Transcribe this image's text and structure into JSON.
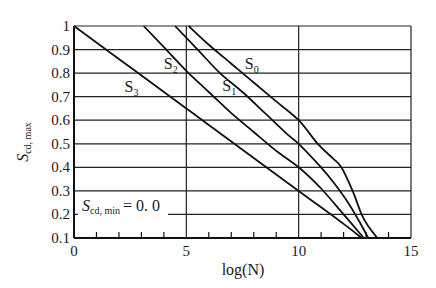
{
  "chart_data": {
    "type": "line",
    "title": "",
    "xlabel": "log(N)",
    "ylabel": "S_cd,max",
    "xlim": [
      0,
      15
    ],
    "ylim": [
      0.1,
      1.0
    ],
    "grid": true,
    "x_ticks": [
      0,
      5,
      10,
      15
    ],
    "x_tick_labels": [
      "0",
      "5",
      "10",
      "15"
    ],
    "x_minor_ticks": [
      1,
      2,
      3,
      4,
      6,
      7,
      8,
      9,
      11,
      12,
      13,
      14
    ],
    "y_ticks": [
      0.1,
      0.2,
      0.3,
      0.4,
      0.5,
      0.6,
      0.7,
      0.8,
      0.9,
      1.0
    ],
    "y_tick_labels": [
      "0.1",
      "0.2",
      "0.3",
      "0.4",
      "0.5",
      "0.6",
      "0.7",
      "0.8",
      "0.9",
      "1"
    ],
    "annotation": {
      "text_main": "S",
      "text_sub": "cd, min",
      "text_value": "= 0. 0"
    },
    "legend": "inline curve labels",
    "series": [
      {
        "name": "S0",
        "label_main": "S",
        "label_sub": "0",
        "x": [
          5.1,
          6.0,
          7.0,
          8.0,
          9.0,
          10.0,
          10.85,
          11.5,
          11.9,
          12.4,
          12.8,
          13.1,
          13.5
        ],
        "y": [
          1.0,
          0.92,
          0.84,
          0.76,
          0.68,
          0.6,
          0.5,
          0.44,
          0.4,
          0.3,
          0.2,
          0.15,
          0.1
        ]
      },
      {
        "name": "S1",
        "label_main": "S",
        "label_sub": "1",
        "x": [
          4.5,
          5.5,
          6.5,
          7.5,
          8.5,
          9.5,
          10.0,
          11.0,
          11.6,
          12.2,
          12.7,
          13.1
        ],
        "y": [
          1.0,
          0.9,
          0.8,
          0.72,
          0.63,
          0.54,
          0.5,
          0.4,
          0.33,
          0.25,
          0.17,
          0.1
        ]
      },
      {
        "name": "S2",
        "label_main": "S",
        "label_sub": "2",
        "x": [
          3.1,
          4.0,
          5.0,
          6.0,
          7.0,
          8.0,
          9.0,
          10.0,
          11.0,
          12.0,
          12.9
        ],
        "y": [
          1.0,
          0.91,
          0.81,
          0.72,
          0.63,
          0.55,
          0.47,
          0.4,
          0.31,
          0.2,
          0.1
        ]
      },
      {
        "name": "S3",
        "label_main": "S",
        "label_sub": "3",
        "x": [
          0.0,
          2.0,
          4.0,
          5.0,
          6.0,
          8.0,
          10.0,
          12.0,
          12.8
        ],
        "y": [
          1.0,
          0.86,
          0.72,
          0.65,
          0.58,
          0.44,
          0.3,
          0.16,
          0.1
        ]
      }
    ],
    "label_positions": [
      {
        "series": "S0",
        "x": 7.6,
        "y": 0.845
      },
      {
        "series": "S1",
        "x": 6.6,
        "y": 0.75
      },
      {
        "series": "S2",
        "x": 4.0,
        "y": 0.845
      },
      {
        "series": "S3",
        "x": 2.25,
        "y": 0.745
      }
    ]
  }
}
